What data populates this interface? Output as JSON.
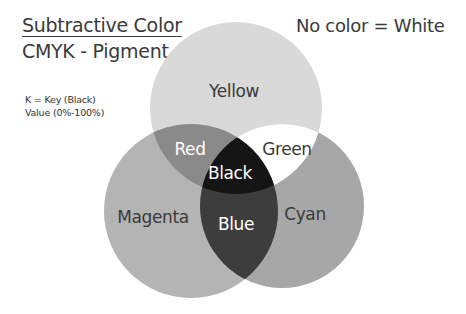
{
  "header": {
    "title": "Subtractive Color",
    "subtitle": "CMYK - Pigment",
    "note_right": "No color = White"
  },
  "key_note": {
    "line1": "K = Key (Black)",
    "line2": "Value (0%-100%)"
  },
  "colors": {
    "yellow_fill": "#d9d9d9",
    "magenta_fill": "#b4b4b4",
    "cyan_fill": "#a7a7a7",
    "red_fill": "#8a8a8a",
    "green_fill": "#ffffff",
    "blue_fill": "#3d3d3d",
    "black_fill": "#151515",
    "dark_label": "#3a3a3a",
    "light_label": "#ffffff"
  },
  "venn": {
    "circles": [
      {
        "name": "Yellow",
        "cx": 236,
        "cy": 108,
        "r": 86
      },
      {
        "name": "Magenta",
        "cx": 191,
        "cy": 211,
        "r": 87
      },
      {
        "name": "Cyan",
        "cx": 282,
        "cy": 206,
        "r": 82
      }
    ],
    "labels": {
      "yellow": "Yellow",
      "magenta": "Magenta",
      "cyan": "Cyan",
      "red": "Red",
      "green": "Green",
      "blue": "Blue",
      "black": "Black"
    }
  }
}
